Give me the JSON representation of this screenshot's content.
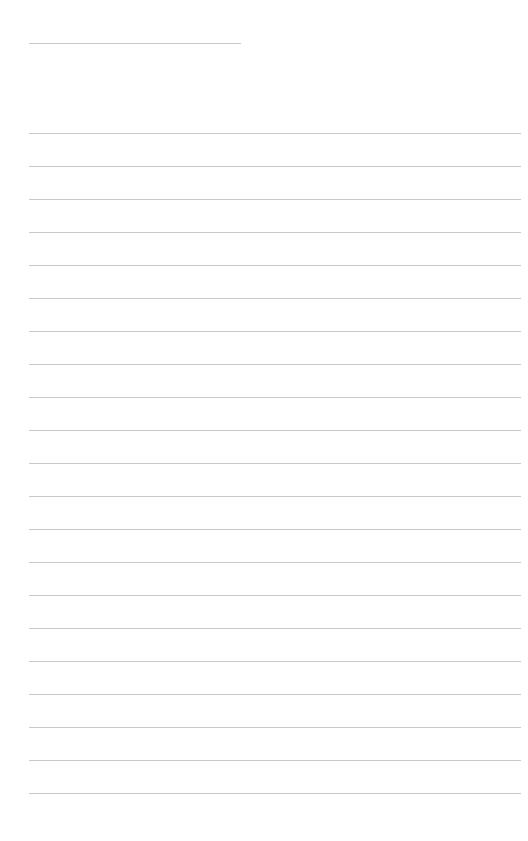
{
  "page": {
    "type": "lined-paper",
    "background_color": "#ffffff",
    "line_color": "#c9c9c9",
    "header_line": {
      "x": 29,
      "y": 43,
      "width": 212
    },
    "ruled_lines": {
      "count": 21,
      "start_y": 133,
      "spacing": 33,
      "x": 29,
      "width": 492
    }
  }
}
